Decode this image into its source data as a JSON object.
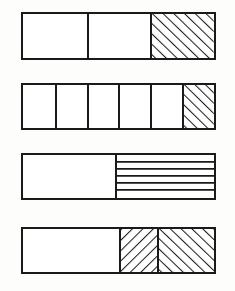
{
  "figure": {
    "background_color": "#fdfdfc",
    "stroke_color": "#1a1a1a",
    "fill_color": "#ffffff",
    "bar_geometry": {
      "left_px": 21,
      "width_px": 195,
      "height_px": 48,
      "tops_px": [
        12,
        83,
        153,
        227
      ]
    }
  },
  "chart_data": {
    "type": "bar",
    "title": "",
    "subtitle": "",
    "xlabel": "",
    "ylabel": "",
    "grid": false,
    "legend": "none",
    "orientation": "horizontal",
    "categories": [
      "bar-1",
      "bar-2",
      "bar-3",
      "bar-4"
    ],
    "values": [
      0.3333,
      0.1667,
      0.5,
      0.5
    ],
    "bars": [
      {
        "id": "bar-1",
        "segment_count": 3,
        "shaded_count": 1,
        "fraction_label": "1/3",
        "fraction_value": 0.3333,
        "segments": [
          {
            "index": 1,
            "width_fraction": 0.3333,
            "fill": "blank",
            "hatch": "none"
          },
          {
            "index": 2,
            "width_fraction": 0.3333,
            "fill": "blank",
            "hatch": "none"
          },
          {
            "index": 3,
            "width_fraction": 0.3334,
            "fill": "hatched",
            "hatch": "diagonal-up-right",
            "hatch_spacing_px": 8,
            "hatch_angle_deg": 45
          }
        ]
      },
      {
        "id": "bar-2",
        "segment_count": 6,
        "shaded_count": 1,
        "fraction_label": "1/6",
        "fraction_value": 0.1667,
        "segments": [
          {
            "index": 1,
            "width_fraction": 0.1667,
            "fill": "blank",
            "hatch": "none"
          },
          {
            "index": 2,
            "width_fraction": 0.1667,
            "fill": "blank",
            "hatch": "none"
          },
          {
            "index": 3,
            "width_fraction": 0.1667,
            "fill": "blank",
            "hatch": "none"
          },
          {
            "index": 4,
            "width_fraction": 0.1667,
            "fill": "blank",
            "hatch": "none"
          },
          {
            "index": 5,
            "width_fraction": 0.1667,
            "fill": "blank",
            "hatch": "none"
          },
          {
            "index": 6,
            "width_fraction": 0.1665,
            "fill": "hatched",
            "hatch": "diagonal-up-right",
            "hatch_spacing_px": 8,
            "hatch_angle_deg": 45
          }
        ]
      },
      {
        "id": "bar-3",
        "segment_count": 2,
        "shaded_count": 1,
        "fraction_label": "1/2",
        "fraction_value": 0.5,
        "segments": [
          {
            "index": 1,
            "width_fraction": 0.48,
            "fill": "blank",
            "hatch": "none"
          },
          {
            "index": 2,
            "width_fraction": 0.52,
            "fill": "hatched",
            "hatch": "horizontal",
            "hatch_line_count": 5,
            "hatch_spacing_px": 8,
            "hatch_angle_deg": 0
          }
        ]
      },
      {
        "id": "bar-4",
        "segment_count": 3,
        "shaded_count": 2,
        "fraction_label": "1/2",
        "fraction_value": 0.5,
        "segments": [
          {
            "index": 1,
            "width_fraction": 0.5,
            "fill": "blank",
            "hatch": "none"
          },
          {
            "index": 2,
            "width_fraction": 0.2,
            "fill": "hatched",
            "hatch": "diagonal-down-right",
            "hatch_spacing_px": 8,
            "hatch_angle_deg": -45
          },
          {
            "index": 3,
            "width_fraction": 0.3,
            "fill": "hatched",
            "hatch": "diagonal-up-right",
            "hatch_spacing_px": 8,
            "hatch_angle_deg": 45
          }
        ]
      }
    ]
  }
}
